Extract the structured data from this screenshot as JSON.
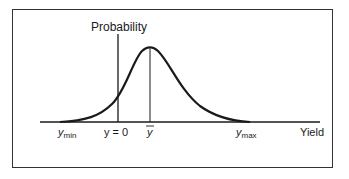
{
  "diagram": {
    "y_axis_label": "Probability",
    "x_axis_label": "Yield",
    "ticks": {
      "ymin": {
        "base": "y",
        "sub": "min"
      },
      "zero": "y = 0",
      "mean": "y",
      "ymax": {
        "base": "y",
        "sub": "max"
      }
    },
    "curve": "right-skewed bell-shaped probability distribution of yield",
    "colors": {
      "line": "#1a1a1a",
      "frame": "#333333",
      "background": "#ffffff"
    }
  }
}
